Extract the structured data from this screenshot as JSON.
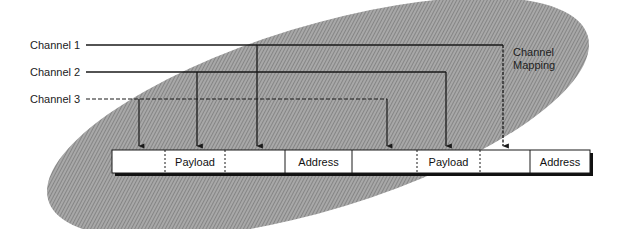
{
  "diagram": {
    "title": "Channel Mapping",
    "mapping_label_line1": "Channel",
    "mapping_label_line2": "Mapping",
    "channels": [
      {
        "label": "Channel 1",
        "style": "solid",
        "y": 45,
        "targets": [
          257,
          503
        ]
      },
      {
        "label": "Channel 2",
        "style": "solid",
        "y": 72,
        "targets": [
          197,
          446
        ]
      },
      {
        "label": "Channel 3",
        "style": "dashed",
        "y": 99,
        "targets": [
          139,
          387
        ]
      }
    ],
    "frame": {
      "segments": [
        {
          "label": "",
          "x1": 112,
          "x2": 165,
          "right_border": "dotted"
        },
        {
          "label": "Payload",
          "x1": 165,
          "x2": 225,
          "right_border": "dotted"
        },
        {
          "label": "",
          "x1": 225,
          "x2": 285,
          "right_border": "solid"
        },
        {
          "label": "Address",
          "x1": 285,
          "x2": 352,
          "right_border": "solid"
        },
        {
          "label": "",
          "x1": 352,
          "x2": 417,
          "right_border": "dotted"
        },
        {
          "label": "Payload",
          "x1": 417,
          "x2": 480,
          "right_border": "dotted"
        },
        {
          "label": "",
          "x1": 480,
          "x2": 530,
          "right_border": "solid"
        },
        {
          "label": "Address",
          "x1": 530,
          "x2": 590,
          "right_border": "none"
        }
      ]
    },
    "colors": {
      "ellipse_fill": "#9a9a9a",
      "line": "#1a1a1a",
      "frame_fill": "#ffffff",
      "shadow": "#111111"
    }
  }
}
